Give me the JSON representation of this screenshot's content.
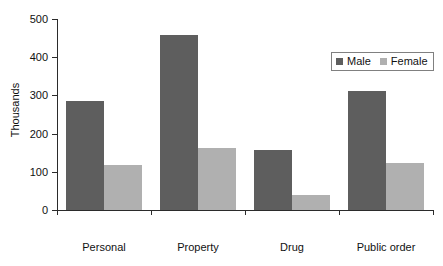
{
  "chart_data": {
    "type": "bar",
    "title": "",
    "subtitle": "",
    "xlabel": "",
    "ylabel": "Thousands",
    "categories": [
      "Personal",
      "Property",
      "Drug",
      "Public order"
    ],
    "series": [
      {
        "name": "Male",
        "color": "#5e5e5e",
        "values": [
          285,
          458,
          158,
          312
        ]
      },
      {
        "name": "Female",
        "color": "#b0b0b0",
        "values": [
          117,
          162,
          40,
          123
        ]
      }
    ],
    "ylim": [
      0,
      500
    ],
    "y_ticks": [
      0,
      100,
      200,
      300,
      400,
      500
    ],
    "y_tick_labels": [
      "0",
      "100",
      "200",
      "300",
      "400",
      "500"
    ],
    "grid": false,
    "legend_position": "top-right",
    "legend_entries": [
      "Male",
      "Female"
    ]
  },
  "legend": {
    "male_label": "Male",
    "female_label": "Female"
  },
  "axes": {
    "y_title": "Thousands"
  }
}
